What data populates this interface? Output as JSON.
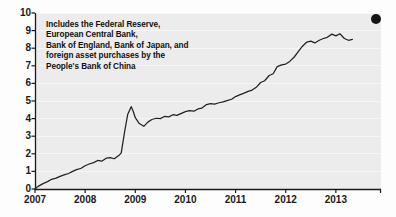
{
  "chart_data": {
    "type": "line",
    "title": "",
    "subtitle": "",
    "xlabel": "",
    "ylabel": "",
    "xlim": [
      2007.0,
      2013.9
    ],
    "ylim": [
      0,
      10
    ],
    "grid": true,
    "legend_position": "none",
    "x_tick_labels": [
      "2007",
      "2008",
      "2009",
      "2010",
      "2011",
      "2012",
      "2013"
    ],
    "x_tick_values": [
      2007,
      2008,
      2009,
      2010,
      2011,
      2012,
      2013
    ],
    "y_tick_labels": [
      "0",
      "1",
      "2",
      "3",
      "4",
      "5",
      "6",
      "7",
      "8",
      "9",
      "10"
    ],
    "y_tick_values": [
      0,
      1,
      2,
      3,
      4,
      5,
      6,
      7,
      8,
      9,
      10
    ],
    "annotations": [
      {
        "name": "scope-note",
        "lines": [
          "Includes the Federal Reserve,",
          "European Central Bank,",
          "Bank of England, Bank of Japan, and",
          "foreign asset purchases by the",
          "People's Bank of China"
        ]
      }
    ],
    "markers": [
      {
        "name": "corner-dot",
        "shape": "circle",
        "color": "#151515",
        "x": 2013.8,
        "y": 9.65
      }
    ],
    "series": [
      {
        "name": "Central bank balance sheets",
        "color": "#222222",
        "x": [
          2007.0,
          2007.08,
          2007.17,
          2007.25,
          2007.33,
          2007.42,
          2007.5,
          2007.58,
          2007.67,
          2007.75,
          2007.83,
          2007.92,
          2008.0,
          2008.08,
          2008.17,
          2008.25,
          2008.33,
          2008.42,
          2008.5,
          2008.58,
          2008.67,
          2008.72,
          2008.79,
          2008.85,
          2008.92,
          2008.96,
          2009.0,
          2009.08,
          2009.17,
          2009.25,
          2009.33,
          2009.42,
          2009.5,
          2009.58,
          2009.67,
          2009.75,
          2009.83,
          2009.92,
          2010.0,
          2010.08,
          2010.17,
          2010.25,
          2010.33,
          2010.42,
          2010.5,
          2010.58,
          2010.67,
          2010.75,
          2010.83,
          2010.92,
          2011.0,
          2011.08,
          2011.17,
          2011.25,
          2011.33,
          2011.42,
          2011.5,
          2011.58,
          2011.67,
          2011.75,
          2011.83,
          2011.92,
          2012.0,
          2012.08,
          2012.17,
          2012.25,
          2012.33,
          2012.42,
          2012.5,
          2012.58,
          2012.67,
          2012.75,
          2012.83,
          2012.92,
          2013.0,
          2013.08,
          2013.17,
          2013.25,
          2013.33
        ],
        "y": [
          0.02,
          0.18,
          0.32,
          0.42,
          0.55,
          0.62,
          0.72,
          0.8,
          0.88,
          1.0,
          1.1,
          1.18,
          1.32,
          1.42,
          1.5,
          1.62,
          1.58,
          1.75,
          1.78,
          1.72,
          1.9,
          2.05,
          3.3,
          4.25,
          4.68,
          4.4,
          4.05,
          3.72,
          3.56,
          3.8,
          3.95,
          4.02,
          4.0,
          4.12,
          4.1,
          4.22,
          4.18,
          4.3,
          4.4,
          4.45,
          4.42,
          4.55,
          4.6,
          4.8,
          4.85,
          4.82,
          4.9,
          4.95,
          5.02,
          5.1,
          5.25,
          5.35,
          5.45,
          5.55,
          5.62,
          5.8,
          6.05,
          6.15,
          6.45,
          6.55,
          6.95,
          7.05,
          7.1,
          7.25,
          7.5,
          7.8,
          8.1,
          8.35,
          8.4,
          8.3,
          8.45,
          8.55,
          8.62,
          8.8,
          8.7,
          8.82,
          8.55,
          8.45,
          8.5
        ]
      }
    ]
  }
}
